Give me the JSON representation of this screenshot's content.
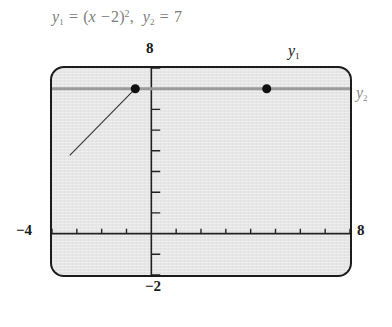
{
  "header": {
    "y1_name": "y",
    "y1_sub": "1",
    "y1_eq": "=",
    "y1_expr_open": "(",
    "y1_var": "x",
    "y1_minus": "−",
    "y1_const": "2",
    "y1_expr_close": ")",
    "y1_power": "2",
    "comma": ",",
    "y2_name": "y",
    "y2_sub": "2",
    "y2_eq": "=",
    "y2_value": "7",
    "full_text": "y₁ = (x − 2)²,  y₂ = 7"
  },
  "window": {
    "ymax_label": "8",
    "ymin_label": "−2",
    "xmin_label": "−4",
    "xmax_label": "8",
    "xmin": -4,
    "xmax": 8,
    "ymin": -2,
    "ymax": 8,
    "xscl": 1,
    "yscl": 1,
    "screen_fill": "#e6e6e6",
    "border_color": "#1c1c1c"
  },
  "curves": [
    {
      "id": "y1",
      "label": "y",
      "label_sub": "1",
      "expression": "(x - 2)^2",
      "type": "parabola",
      "vertex": [
        2,
        0
      ],
      "color": "#2e2e2e",
      "width": 2.4
    },
    {
      "id": "y2",
      "label": "y",
      "label_sub": "2",
      "expression": "7",
      "type": "horizontal-line",
      "y": 7,
      "color": "#9b9b9b",
      "width": 3.2
    }
  ],
  "intersections": [
    {
      "name": "left-intersection",
      "label": "(−0.6457513, 7)",
      "x": -0.6457513,
      "y": 7,
      "has_leader_line": true
    },
    {
      "name": "right-intersection",
      "label": "(4.6457513, 7)",
      "x": 4.6457513,
      "y": 7,
      "has_leader_line": false
    }
  ],
  "chart_data": {
    "type": "line",
    "xlabel": "x",
    "ylabel": "y",
    "xlim": [
      -4,
      8
    ],
    "ylim": [
      -2,
      8
    ],
    "grid": false,
    "legend": "inline-curve-labels",
    "axis_tick_step": 1,
    "annotations": [
      "(−0.6457513, 7)",
      "(4.6457513, 7)"
    ],
    "series": [
      {
        "name": "y1",
        "equation": "(x - 2)^2",
        "color": "#2e2e2e",
        "x": [
          -1.0,
          -0.6457513,
          0.0,
          1.0,
          2.0,
          3.0,
          4.0,
          4.6457513,
          5.0
        ],
        "values": [
          9.0,
          7.0,
          4.0,
          1.0,
          0.0,
          1.0,
          4.0,
          7.0,
          9.0
        ]
      },
      {
        "name": "y2",
        "equation": "7",
        "color": "#9b9b9b",
        "x": [
          -4,
          8
        ],
        "values": [
          7,
          7
        ]
      }
    ],
    "points": [
      {
        "label": "(−0.6457513, 7)",
        "x": -0.6457513,
        "y": 7
      },
      {
        "label": "(4.6457513, 7)",
        "x": 4.6457513,
        "y": 7
      }
    ]
  }
}
